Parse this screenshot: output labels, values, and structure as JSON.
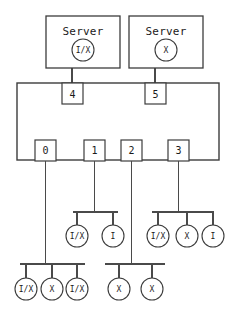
{
  "diagram": {
    "background_color": "#ffffff",
    "line_color": "#4a4a4a",
    "text_color": "#1a1a1a",
    "servers": [
      {
        "id": "server-left",
        "label": "Server",
        "mode": "I/X",
        "x": 83,
        "y": 44,
        "box_x": 46,
        "box_y": 16,
        "box_w": 74,
        "box_h": 52,
        "circle_cx": 83,
        "circle_cy": 48,
        "circle_r": 11
      },
      {
        "id": "server-right",
        "label": "Server",
        "mode": "X",
        "x": 166,
        "y": 44,
        "box_x": 129,
        "box_y": 16,
        "box_w": 74,
        "box_h": 52,
        "circle_cx": 166,
        "circle_cy": 48,
        "circle_r": 11
      }
    ],
    "switch": {
      "id": "switch-body",
      "x": 17,
      "y": 83,
      "width": 202,
      "height": 77
    },
    "ports": [
      {
        "label": "4",
        "x": 72,
        "y": 83,
        "side": "top"
      },
      {
        "label": "5",
        "x": 155,
        "y": 83,
        "side": "top"
      },
      {
        "label": "0",
        "x": 45,
        "y": 160,
        "side": "bottom"
      },
      {
        "label": "1",
        "x": 94,
        "y": 160,
        "side": "bottom"
      },
      {
        "label": "2",
        "x": 131,
        "y": 160,
        "side": "bottom"
      },
      {
        "label": "3",
        "x": 178,
        "y": 160,
        "side": "bottom"
      }
    ],
    "buses": [
      {
        "id": "bus-mid-left",
        "y": 212,
        "x1": 73,
        "x2": 118,
        "from_port": "1"
      },
      {
        "id": "bus-mid-right",
        "y": 212,
        "x1": 152,
        "x2": 212,
        "from_port": "3"
      },
      {
        "id": "bus-bottom-left",
        "y": 264,
        "x1": 20,
        "x2": 85,
        "from_port": "0"
      },
      {
        "id": "bus-bottom-right",
        "y": 264,
        "x1": 105,
        "x2": 165,
        "from_port": "2"
      }
    ],
    "leaf_nodes": [
      {
        "id": "leaf-mid-left-1",
        "mode": "I/X",
        "cx": 77,
        "cy": 236,
        "r": 11,
        "bus": "bus-mid-left"
      },
      {
        "id": "leaf-mid-left-2",
        "mode": "I",
        "cx": 113,
        "cy": 236,
        "r": 11,
        "bus": "bus-mid-left"
      },
      {
        "id": "leaf-mid-right-1",
        "mode": "I/X",
        "cx": 158,
        "cy": 236,
        "r": 11,
        "bus": "bus-mid-right"
      },
      {
        "id": "leaf-mid-right-2",
        "mode": "X",
        "cx": 187,
        "cy": 236,
        "r": 11,
        "bus": "bus-mid-right"
      },
      {
        "id": "leaf-mid-right-3",
        "mode": "I",
        "cx": 214,
        "cy": 236,
        "r": 11,
        "bus": "bus-mid-right"
      },
      {
        "id": "leaf-bottom-left-1",
        "mode": "I/X",
        "cx": 26,
        "cy": 289,
        "r": 11,
        "bus": "bus-bottom-left"
      },
      {
        "id": "leaf-bottom-left-2",
        "mode": "X",
        "cx": 52,
        "cy": 289,
        "r": 11,
        "bus": "bus-bottom-left"
      },
      {
        "id": "leaf-bottom-left-3",
        "mode": "I/X",
        "cx": 77,
        "cy": 289,
        "r": 11,
        "bus": "bus-bottom-left"
      },
      {
        "id": "leaf-bottom-right-1",
        "mode": "X",
        "cx": 119,
        "cy": 289,
        "r": 11,
        "bus": "bus-bottom-right"
      },
      {
        "id": "leaf-bottom-right-2",
        "mode": "X",
        "cx": 152,
        "cy": 289,
        "r": 11,
        "bus": "bus-bottom-right"
      }
    ]
  }
}
